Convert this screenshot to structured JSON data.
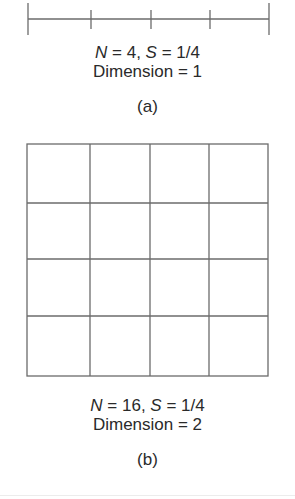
{
  "figure_a": {
    "line": {
      "x_start": 28,
      "x_end": 269,
      "y": 19,
      "segments": 4
    },
    "caption": {
      "n_var": "N",
      "n_rest": " = 4, ",
      "s_var": "S",
      "s_rest": " = 1/4"
    },
    "dimension": "Dimension = 1",
    "label": "(a)"
  },
  "figure_b": {
    "grid": {
      "x": 27,
      "y": 144,
      "width": 241,
      "height": 232,
      "rows": 4,
      "cols": 4
    },
    "caption": {
      "n_var": "N",
      "n_rest": " = 16, ",
      "s_var": "S",
      "s_rest": " = 1/4"
    },
    "dimension": "Dimension = 2",
    "label": "(b)"
  },
  "colors": {
    "stroke": "#6b6b6b",
    "text": "#2a2a2a"
  }
}
